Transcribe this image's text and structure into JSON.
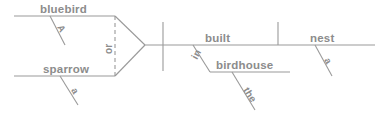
{
  "diagram": {
    "type": "reed-kellogg-sentence-diagram",
    "sentence": "A bluebird or a sparrow built the nest in the birdhouse",
    "line_color": "#9a9a9a",
    "text_color": "#8c8c8c",
    "background": "#ffffff",
    "subjects": {
      "compound": true,
      "conjunction": "or",
      "branches": [
        {
          "word": "bluebird",
          "modifier": "A",
          "position": "upper"
        },
        {
          "word": "sparrow",
          "modifier": "a",
          "position": "lower"
        }
      ]
    },
    "predicate": {
      "verb": "built",
      "direct_object": "nest",
      "object_modifier": "a"
    },
    "prepositional_phrase": {
      "preposition": "in",
      "object": "birdhouse",
      "object_modifier": "the"
    }
  }
}
